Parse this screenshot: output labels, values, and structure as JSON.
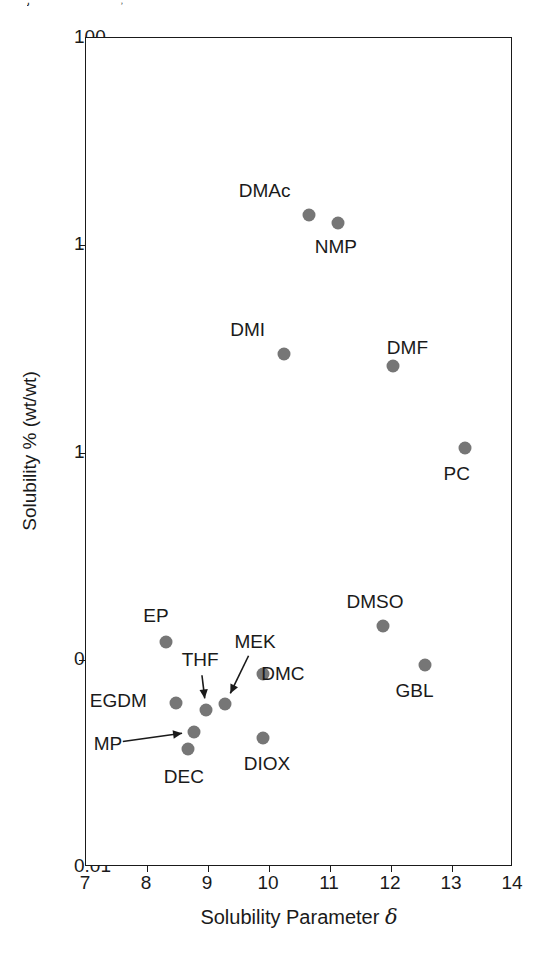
{
  "page": {
    "bleed_fragment_left": "j",
    "bleed_fragment_right": ","
  },
  "chart_data": {
    "type": "scatter",
    "title": "",
    "xlabel": "Solubility Parameter δ",
    "ylabel": "Solubility % (wt/wt)",
    "xlim": [
      7,
      14
    ],
    "ylim": [
      0.01,
      100
    ],
    "yscale": "log",
    "xscale": "linear",
    "grid": false,
    "legend": false,
    "xticks": [
      "7",
      "8",
      "9",
      "10",
      "11",
      "12",
      "13",
      "14"
    ],
    "yticks": [
      "100",
      "10",
      "1",
      "0.1",
      "0.01"
    ],
    "marker_color": "#767676",
    "axis_color": "#1a1a1a",
    "points": [
      {
        "name": "DMAc",
        "x": 10.65,
        "y": 14.0,
        "label_dx": -44,
        "label_dy": -24,
        "arrow": false
      },
      {
        "name": "NMP",
        "x": 11.13,
        "y": 12.8,
        "label_dx": -2,
        "label_dy": 24,
        "arrow": false
      },
      {
        "name": "DMI",
        "x": 10.24,
        "y": 3.0,
        "label_dx": -36,
        "label_dy": -24,
        "arrow": false
      },
      {
        "name": "DMF",
        "x": 12.04,
        "y": 2.6,
        "label_dx": 14,
        "label_dy": -18,
        "arrow": false
      },
      {
        "name": "PC",
        "x": 13.21,
        "y": 1.05,
        "label_dx": -8,
        "label_dy": 26,
        "arrow": false
      },
      {
        "name": "DMSO",
        "x": 11.87,
        "y": 0.145,
        "label_dx": -8,
        "label_dy": -24,
        "arrow": false
      },
      {
        "name": "GBL",
        "x": 12.55,
        "y": 0.094,
        "label_dx": -10,
        "label_dy": 26,
        "arrow": false
      },
      {
        "name": "EP",
        "x": 8.31,
        "y": 0.122,
        "label_dx": -10,
        "label_dy": -26,
        "arrow": false
      },
      {
        "name": "EGDM",
        "x": 8.48,
        "y": 0.062,
        "label_dx": -58,
        "label_dy": -2,
        "arrow": false
      },
      {
        "name": "THF",
        "x": 8.97,
        "y": 0.057,
        "label_dx": -6,
        "label_dy": -50,
        "arrow": true
      },
      {
        "name": "MEK",
        "x": 9.28,
        "y": 0.061,
        "label_dx": 30,
        "label_dy": -62,
        "arrow": true
      },
      {
        "name": "DMC",
        "x": 9.9,
        "y": 0.085,
        "label_dx": 20,
        "label_dy": 0,
        "arrow": false
      },
      {
        "name": "MP",
        "x": 8.77,
        "y": 0.045,
        "label_dx": -86,
        "label_dy": 12,
        "arrow": true
      },
      {
        "name": "DEC",
        "x": 8.67,
        "y": 0.037,
        "label_dx": -4,
        "label_dy": 28,
        "arrow": false
      },
      {
        "name": "DIOX",
        "x": 9.9,
        "y": 0.042,
        "label_dx": 4,
        "label_dy": 26,
        "arrow": false
      }
    ]
  }
}
